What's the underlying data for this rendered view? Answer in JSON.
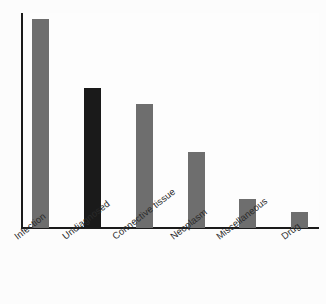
{
  "chart_data": {
    "type": "bar",
    "title": "",
    "subtitle": "",
    "xlabel": "",
    "ylabel": "",
    "categories": [
      "Infection",
      "Undiagnosed",
      "Connective tissue",
      "Neoplasm",
      "Miscellaneous",
      "Drug"
    ],
    "values": [
      100,
      67,
      59,
      36,
      14,
      8
    ],
    "ylim": [
      0,
      100
    ],
    "grid": false,
    "legend": false,
    "axis_tick_labels_rotated": true,
    "bar_colors": [
      "#6e6e6e",
      "#1a1a1a",
      "#6e6e6e",
      "#6e6e6e",
      "#6e6e6e",
      "#6e6e6e"
    ],
    "series": [
      {
        "name": "Frequency",
        "values": [
          100,
          67,
          59,
          36,
          14,
          8
        ]
      }
    ],
    "bars": [
      {
        "label": "Infection",
        "value": 100,
        "color": "#6e6e6e",
        "x": 32,
        "width": 17,
        "top": 19,
        "height": 209
      },
      {
        "label": "Undiagnosed",
        "value": 67,
        "color": "#1a1a1a",
        "x": 84,
        "width": 17,
        "top": 88,
        "height": 140
      },
      {
        "label": "Connective tissue",
        "value": 59,
        "color": "#6e6e6e",
        "x": 136,
        "width": 17,
        "top": 104,
        "height": 124
      },
      {
        "label": "Neoplasm",
        "value": 36,
        "color": "#6e6e6e",
        "x": 188,
        "width": 17,
        "top": 152,
        "height": 76
      },
      {
        "label": "Miscellaneous",
        "value": 14,
        "color": "#6e6e6e",
        "x": 239,
        "width": 17,
        "top": 199,
        "height": 29
      },
      {
        "label": "Drug",
        "value": 8,
        "color": "#6e6e6e",
        "x": 291,
        "width": 17,
        "top": 212,
        "height": 16
      }
    ],
    "tick_label_positions": [
      {
        "label": "Infection",
        "x": 12,
        "y": 4
      },
      {
        "label": "Undiagnosed",
        "x": 60,
        "y": 4
      },
      {
        "label": "Connective tissue",
        "x": 110,
        "y": 4
      },
      {
        "label": "Neoplasm",
        "x": 168,
        "y": 4
      },
      {
        "label": "Miscellaneous",
        "x": 214,
        "y": 4
      },
      {
        "label": "Drug",
        "x": 279,
        "y": 4
      }
    ],
    "axis_color": "#1b1b1b",
    "background_color": "#fcfcfc"
  }
}
